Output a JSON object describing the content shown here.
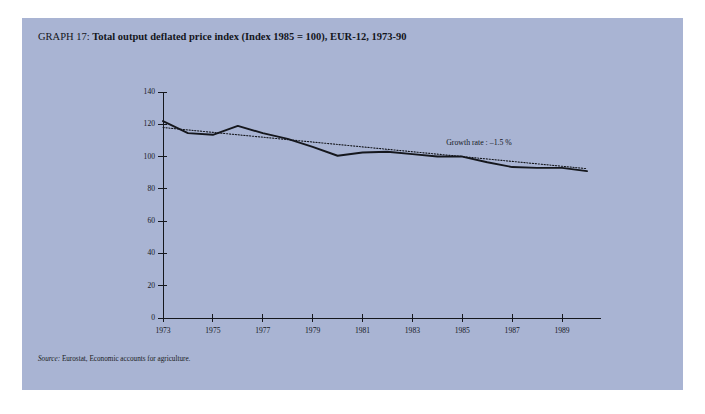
{
  "figure": {
    "title_prefix": "GRAPH 17: ",
    "title_main": "Total output deflated price index (Index 1985 = 100), EUR-12, 1973-90",
    "source_label": "Source:",
    "source_text": " Eurostat, Economic accounts for agriculture.",
    "panel_color": "#a9b4d3",
    "ink_color": "#15171d"
  },
  "chart_data": {
    "type": "line",
    "title": "Total output deflated price index (Index 1985 = 100), EUR-12, 1973-90",
    "xlabel": "",
    "ylabel": "",
    "xlim": [
      1973,
      1990
    ],
    "ylim": [
      0,
      140
    ],
    "yticks": [
      0,
      20,
      40,
      60,
      80,
      100,
      120,
      140
    ],
    "xticks": [
      1973,
      1975,
      1977,
      1979,
      1981,
      1983,
      1985,
      1987,
      1989
    ],
    "xtick_labels": [
      "1973",
      "1975",
      "1977",
      "1979",
      "1981",
      "1983",
      "1985",
      "1987",
      "1989"
    ],
    "ytick_labels": [
      "0",
      "20",
      "40",
      "60",
      "80",
      "100",
      "120",
      "140"
    ],
    "grid": false,
    "legend": "none",
    "x": [
      1973,
      1974,
      1975,
      1976,
      1977,
      1978,
      1979,
      1980,
      1981,
      1982,
      1983,
      1984,
      1985,
      1986,
      1987,
      1988,
      1989,
      1990
    ],
    "series": [
      {
        "name": "Total output deflated price index",
        "style": "solid",
        "values": [
          122.0,
          114.5,
          113.5,
          119.0,
          114.5,
          111.0,
          106.0,
          100.5,
          102.5,
          103.0,
          101.5,
          100.0,
          100.0,
          96.5,
          93.5,
          93.0,
          93.0,
          91.0
        ]
      },
      {
        "name": "Trend (growth rate -1.5 %)",
        "style": "dotted",
        "values": [
          118.0,
          116.5,
          115.0,
          113.5,
          112.0,
          110.5,
          109.0,
          107.5,
          106.0,
          104.5,
          103.0,
          101.5,
          100.0,
          98.5,
          97.0,
          95.5,
          94.0,
          92.5
        ]
      }
    ],
    "annotations": [
      {
        "text": "Growth rate : –1.5 %",
        "x": 1986.2,
        "y": 107.5
      }
    ]
  }
}
